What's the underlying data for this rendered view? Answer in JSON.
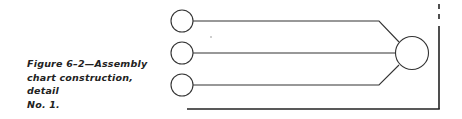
{
  "caption": {
    "line1": "Figure 6–2—Assembly",
    "line2": "chart construction, detail",
    "line3": "No. 1."
  },
  "diagram": {
    "type": "assembly-chart",
    "input_components": 3,
    "assembly_nodes": 1,
    "stroke_color": "#333333"
  }
}
